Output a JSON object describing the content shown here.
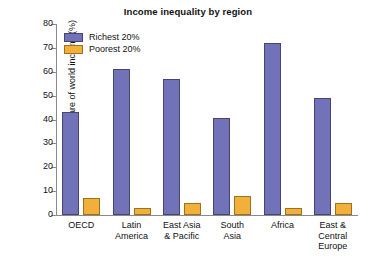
{
  "chart_data": {
    "type": "bar",
    "title": "Income inequality by region",
    "xlabel": "",
    "ylabel": "Share of world income (%)",
    "ylim": [
      0,
      80
    ],
    "yticks": [
      0,
      10,
      20,
      30,
      40,
      50,
      60,
      70,
      80
    ],
    "grid": false,
    "legend_position": "top-left-inside",
    "categories": [
      "OECD",
      "Latin America",
      "East Asia & Pacific",
      "South Asia",
      "Africa",
      "East & Central Europe"
    ],
    "category_lines": [
      [
        "OECD"
      ],
      [
        "Latin",
        "America"
      ],
      [
        "East Asia",
        "& Pacific"
      ],
      [
        "South",
        "Asia"
      ],
      [
        "Africa"
      ],
      [
        "East &",
        "Central",
        "Europe"
      ]
    ],
    "series": [
      {
        "name": "Richest 20%",
        "color": "#7272b8",
        "values": [
          43,
          61,
          57,
          40.5,
          72,
          49
        ]
      },
      {
        "name": "Poorest 20%",
        "color": "#f0b03a",
        "values": [
          7,
          3,
          5,
          8,
          3,
          5
        ]
      }
    ]
  },
  "colors": {
    "richest": "#7272b8",
    "poorest": "#f0b03a",
    "axis": "#8a8a8a",
    "text": "#111111",
    "background": "#ffffff"
  }
}
